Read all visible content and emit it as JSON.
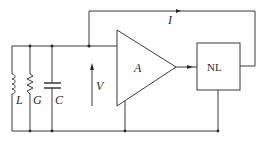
{
  "diagram": {
    "type": "circuit",
    "colors": {
      "line": "#3a3a3a",
      "text": "#2a2a2a",
      "background": "#ffffff"
    },
    "components": {
      "inductor": {
        "label": "L"
      },
      "conductance": {
        "label": "G"
      },
      "capacitor": {
        "label": "C"
      },
      "voltage": {
        "label": "V"
      },
      "amplifier": {
        "label": "A"
      },
      "nonlinear_block": {
        "label": "NL"
      },
      "feedback_current": {
        "label": "I"
      }
    }
  }
}
